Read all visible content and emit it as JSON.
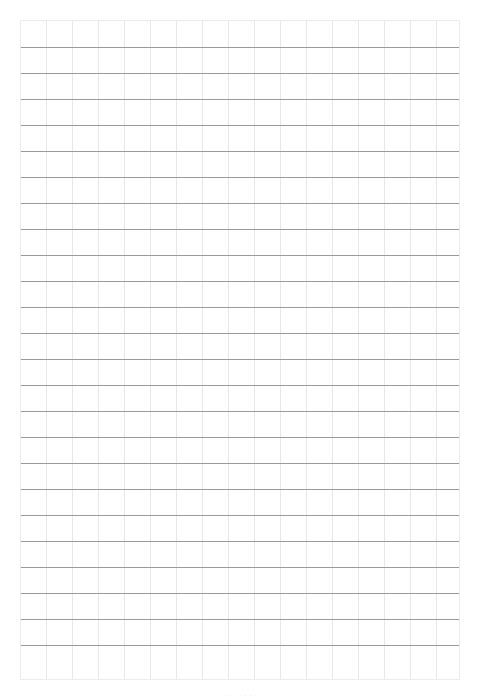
{
  "page": {
    "type": "grid-paper",
    "grid": {
      "columns": 17,
      "rows": 25,
      "cell_size_px": 26,
      "horizontal_line_color": "#9a9a9a",
      "vertical_line_color": "#e8e8e8"
    },
    "footer_text": "· · · · · · · ·"
  }
}
